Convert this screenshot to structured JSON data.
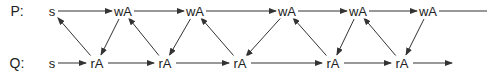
{
  "diagram": {
    "rows": [
      {
        "id": "P",
        "label": "P:",
        "y": 11
      },
      {
        "id": "Q",
        "label": "Q:",
        "y": 63
      }
    ],
    "label_x": 17,
    "nodes": [
      {
        "id": "p0",
        "row": "P",
        "text": "s",
        "x": 52
      },
      {
        "id": "p1",
        "row": "P",
        "text": "wA",
        "x": 123
      },
      {
        "id": "p2",
        "row": "P",
        "text": "wA",
        "x": 195
      },
      {
        "id": "p3",
        "row": "P",
        "text": "wA",
        "x": 287
      },
      {
        "id": "p4",
        "row": "P",
        "text": "wA",
        "x": 358
      },
      {
        "id": "p5",
        "row": "P",
        "text": "wA",
        "x": 428
      },
      {
        "id": "q0",
        "row": "Q",
        "text": "s",
        "x": 52
      },
      {
        "id": "q1",
        "row": "Q",
        "text": "rA",
        "x": 97
      },
      {
        "id": "q2",
        "row": "Q",
        "text": "rA",
        "x": 165
      },
      {
        "id": "q3",
        "row": "Q",
        "text": "rA",
        "x": 240
      },
      {
        "id": "q4",
        "row": "Q",
        "text": "rA",
        "x": 333
      },
      {
        "id": "q5",
        "row": "Q",
        "text": "rA",
        "x": 402
      }
    ],
    "edges": [
      {
        "from": "p0",
        "to": "p1",
        "arrow": true
      },
      {
        "from": "p1",
        "to": "p2",
        "arrow": true
      },
      {
        "from": "p2",
        "to": "p3",
        "arrow": true
      },
      {
        "from": "p3",
        "to": "p4",
        "arrow": true
      },
      {
        "from": "p4",
        "to": "p5",
        "arrow": true
      },
      {
        "from": "p5",
        "to_point": [
          487,
          11
        ],
        "arrow": false
      },
      {
        "from": "q0",
        "to": "q1",
        "arrow": true
      },
      {
        "from": "q1",
        "to": "q2",
        "arrow": true
      },
      {
        "from": "q2",
        "to": "q3",
        "arrow": true
      },
      {
        "from": "q3",
        "to": "q4",
        "arrow": true
      },
      {
        "from": "q4",
        "to": "q5",
        "arrow": true
      },
      {
        "from": "q5",
        "to_point": [
          452,
          63
        ],
        "arrow": true
      },
      {
        "from": "q1",
        "to": "p0",
        "arrow": true
      },
      {
        "from": "p1",
        "to": "q1",
        "arrow": true
      },
      {
        "from": "q2",
        "to": "p1",
        "arrow": true
      },
      {
        "from": "p2",
        "to": "q2",
        "arrow": true
      },
      {
        "from": "q3",
        "to": "p2",
        "arrow": true
      },
      {
        "from": "p3",
        "to": "q3",
        "arrow": true
      },
      {
        "from": "q4",
        "to": "p3",
        "arrow": true
      },
      {
        "from": "p4",
        "to": "q4",
        "arrow": true
      },
      {
        "from": "q5",
        "to": "p4",
        "arrow": true
      },
      {
        "from": "p5",
        "to": "q5",
        "arrow": true
      }
    ],
    "colors": {
      "line": "#333333",
      "text": "#222222",
      "background": "#ffffff"
    }
  }
}
